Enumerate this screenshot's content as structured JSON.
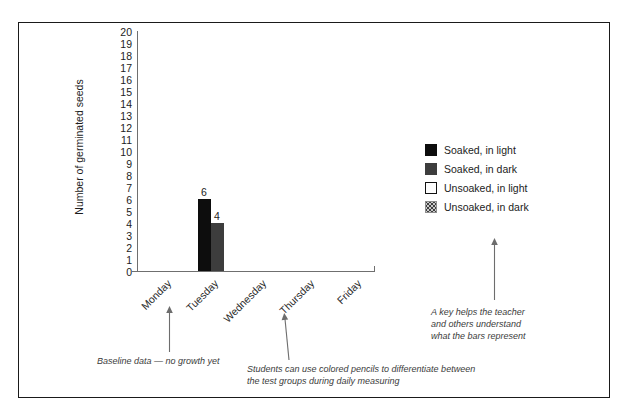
{
  "chart_data": {
    "type": "bar",
    "title": "",
    "xlabel": "",
    "ylabel": "Number of germinated seeds",
    "categories": [
      "Monday",
      "Tuesday",
      "Wednesday",
      "Thursday",
      "Friday"
    ],
    "ylim": [
      0,
      20
    ],
    "yticks": [
      20,
      19,
      18,
      17,
      16,
      15,
      14,
      13,
      12,
      11,
      10,
      9,
      8,
      7,
      6,
      5,
      4,
      3,
      2,
      1,
      0
    ],
    "grid": false,
    "legend_position": "right",
    "series": [
      {
        "name": "Soaked, in light",
        "color": "#0d0d0d",
        "swatch": "solid-black",
        "values": [
          0,
          6,
          0,
          0,
          0
        ]
      },
      {
        "name": "Soaked, in dark",
        "color": "#3d3d3d",
        "swatch": "solid-dark-gray",
        "values": [
          0,
          4,
          0,
          0,
          0
        ]
      },
      {
        "name": "Unsoaked, in light",
        "color": "#ffffff",
        "swatch": "white-outlined",
        "values": [
          0,
          0,
          0,
          0,
          0
        ]
      },
      {
        "name": "Unsoaked, in dark",
        "color": "#c9c9c9",
        "swatch": "dotted-gray",
        "values": [
          0,
          0,
          0,
          0,
          0
        ]
      }
    ],
    "data_labels": [
      {
        "series": "Soaked, in light",
        "category": "Tuesday",
        "value": "6"
      },
      {
        "series": "Soaked, in dark",
        "category": "Tuesday",
        "value": "4"
      }
    ],
    "annotations": [
      {
        "id": "baseline",
        "text": "Baseline data — no growth yet",
        "points_to": "Monday"
      },
      {
        "id": "pencils",
        "text": "Students can use colored pencils to differentiate between\nthe test groups during daily measuring",
        "points_to": "Wednesday"
      },
      {
        "id": "key",
        "text": "A key helps the teacher\nand others understand\nwhat the bars represent",
        "points_to": "legend"
      }
    ]
  },
  "axis": {
    "y_title": "Number of germinated seeds",
    "y_ticks": [
      "20",
      "19",
      "18",
      "17",
      "16",
      "15",
      "14",
      "13",
      "12",
      "11",
      "10",
      "9",
      "8",
      "7",
      "6",
      "5",
      "4",
      "3",
      "2",
      "1",
      "0"
    ],
    "x_ticks": [
      "Monday",
      "Tuesday",
      "Wednesday",
      "Thursday",
      "Friday"
    ]
  },
  "bars": {
    "soaked_light": {
      "label": "6",
      "value": 6
    },
    "soaked_dark": {
      "label": "4",
      "value": 4
    }
  },
  "legend": {
    "items": [
      {
        "label": "Soaked, in light",
        "swatch": "solid-black"
      },
      {
        "label": "Soaked, in dark",
        "swatch": "solid-dark-gray"
      },
      {
        "label": "Unsoaked, in light",
        "swatch": "white-outlined"
      },
      {
        "label": "Unsoaked, in dark",
        "swatch": "dotted-gray"
      }
    ]
  },
  "annotations": {
    "baseline": "Baseline data — no growth yet",
    "pencils": "Students can use colored pencils to differentiate between\nthe test groups during daily measuring",
    "key": "A key helps the teacher\nand others understand\nwhat the bars represent"
  },
  "colors": {
    "bar_light": "#0d0d0d",
    "bar_dark": "#3d3d3d",
    "axis": "#6f6f6f",
    "frame": "#1a1a1a",
    "annotation_text": "#3b3b3b"
  }
}
